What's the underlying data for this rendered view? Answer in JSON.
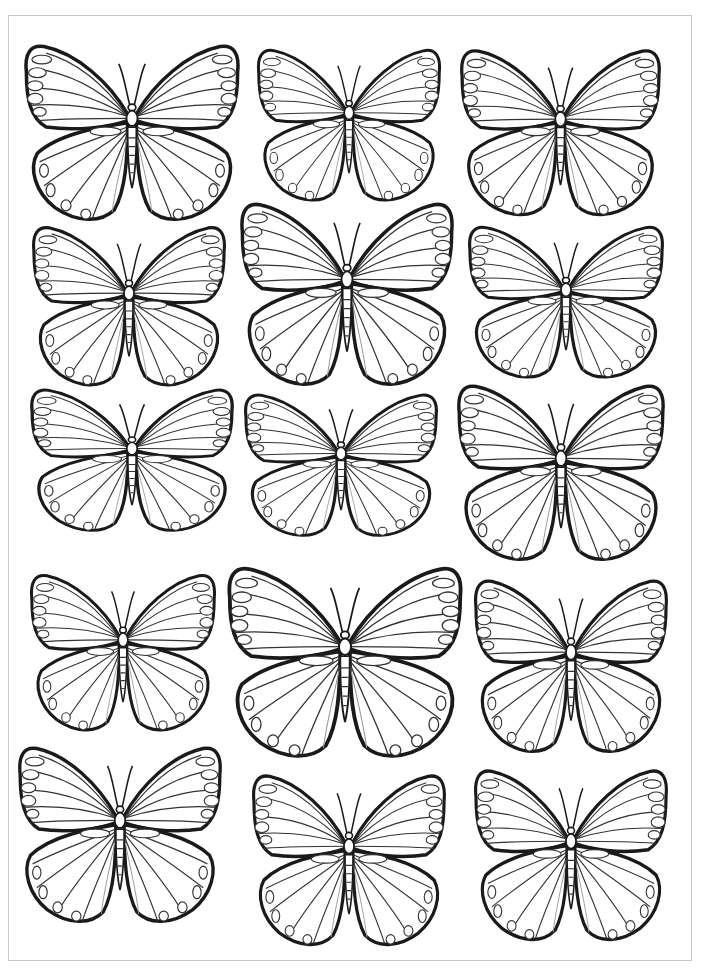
{
  "page": {
    "background": "#ffffff",
    "frame_color": "#c8c8c8",
    "line_color": "#1a1a1a",
    "footer_text": "· · · · · · · · · · · · · · · · · · · ·"
  },
  "butterflies": [
    {
      "id": 1,
      "row": 1,
      "col": 1,
      "x": 22,
      "y": 40,
      "w": 220,
      "h": 185,
      "pattern": "spots-forewing"
    },
    {
      "id": 2,
      "row": 1,
      "col": 2,
      "x": 255,
      "y": 45,
      "w": 188,
      "h": 160,
      "pattern": "radial-veins"
    },
    {
      "id": 3,
      "row": 1,
      "col": 3,
      "x": 458,
      "y": 45,
      "w": 205,
      "h": 175,
      "pattern": "hindwing-eyespots"
    },
    {
      "id": 4,
      "row": 2,
      "col": 1,
      "x": 30,
      "y": 222,
      "w": 198,
      "h": 168,
      "pattern": "spots-forewing"
    },
    {
      "id": 5,
      "row": 2,
      "col": 2,
      "x": 238,
      "y": 198,
      "w": 218,
      "h": 192,
      "pattern": "spots-forewing"
    },
    {
      "id": 6,
      "row": 2,
      "col": 3,
      "x": 466,
      "y": 222,
      "w": 200,
      "h": 160,
      "pattern": "hindwing-ovals"
    },
    {
      "id": 7,
      "row": 3,
      "col": 1,
      "x": 28,
      "y": 385,
      "w": 208,
      "h": 150,
      "pattern": "lacy"
    },
    {
      "id": 8,
      "row": 3,
      "col": 2,
      "x": 242,
      "y": 390,
      "w": 198,
      "h": 150,
      "pattern": "scalloped-edge"
    },
    {
      "id": 9,
      "row": 3,
      "col": 3,
      "x": 455,
      "y": 380,
      "w": 212,
      "h": 185,
      "pattern": "hindwing-ovals"
    },
    {
      "id": 10,
      "row": 4,
      "col": 1,
      "x": 28,
      "y": 570,
      "w": 190,
      "h": 165,
      "pattern": "scalloped-edge"
    },
    {
      "id": 11,
      "row": 4,
      "col": 2,
      "x": 225,
      "y": 562,
      "w": 240,
      "h": 200,
      "pattern": "spots-forewing"
    },
    {
      "id": 12,
      "row": 4,
      "col": 3,
      "x": 472,
      "y": 575,
      "w": 198,
      "h": 182,
      "pattern": "spots-forewing"
    },
    {
      "id": 13,
      "row": 5,
      "col": 1,
      "x": 16,
      "y": 742,
      "w": 208,
      "h": 185,
      "pattern": "scalloped-edge"
    },
    {
      "id": 14,
      "row": 5,
      "col": 2,
      "x": 250,
      "y": 770,
      "w": 198,
      "h": 180,
      "pattern": "scalloped-edge"
    },
    {
      "id": 15,
      "row": 5,
      "col": 3,
      "x": 472,
      "y": 765,
      "w": 198,
      "h": 180,
      "pattern": "hindwing-ovals"
    }
  ]
}
